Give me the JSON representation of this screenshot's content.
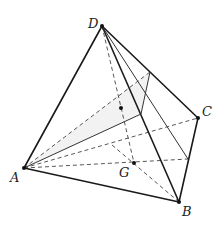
{
  "figure": {
    "type": "tetrahedron",
    "vertices": {
      "A": {
        "label": "A",
        "x": 24,
        "y": 168
      },
      "B": {
        "label": "B",
        "x": 179,
        "y": 202
      },
      "C": {
        "label": "C",
        "x": 198,
        "y": 118
      },
      "D": {
        "label": "D",
        "x": 102,
        "y": 26
      }
    },
    "points": {
      "G": {
        "label": "G",
        "x": 134,
        "y": 163
      },
      "P_DG": {
        "x": 121,
        "y": 108
      },
      "E_DC": {
        "x": 150,
        "y": 72
      },
      "F_DB": {
        "x": 141,
        "y": 114
      },
      "H_BC": {
        "x": 188,
        "y": 159
      },
      "M_AC": {
        "x": 112,
        "y": 145
      }
    },
    "labels": {
      "A": "A",
      "B": "B",
      "C": "C",
      "D": "D",
      "G": "G"
    },
    "colors": {
      "line": "#1a1a1a",
      "dashed": "#444444",
      "shade": "#f2f2f2"
    }
  }
}
